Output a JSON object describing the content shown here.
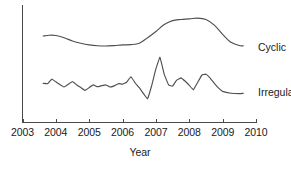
{
  "chart_data": {
    "type": "line",
    "title": "",
    "xlabel": "Year",
    "ylabel": "",
    "grid": false,
    "legend_position": "right-inline",
    "xlim": [
      2003,
      2010
    ],
    "ylim": [
      0,
      10
    ],
    "xticks": [
      2003,
      2004,
      2005,
      2006,
      2007,
      2008,
      2009,
      2010
    ],
    "xtick_labels": [
      "2003",
      "2004",
      "2005",
      "2006",
      "2007",
      "2008",
      "2009",
      "2010"
    ],
    "yticks": [],
    "ytick_labels": [],
    "series": [
      {
        "name": "Cyclic",
        "label_x": 2010.0,
        "label_y": 6.55,
        "x": [
          2003.62,
          2003.8,
          2004.0,
          2004.25,
          2004.5,
          2004.75,
          2005.0,
          2005.25,
          2005.5,
          2005.75,
          2006.0,
          2006.25,
          2006.5,
          2006.75,
          2007.0,
          2007.25,
          2007.5,
          2007.75,
          2008.0,
          2008.25,
          2008.5,
          2008.75,
          2009.0,
          2009.25,
          2009.5,
          2009.62
        ],
        "y": [
          7.55,
          7.62,
          7.6,
          7.4,
          7.12,
          6.92,
          6.78,
          6.7,
          6.68,
          6.72,
          6.78,
          6.8,
          6.92,
          7.4,
          7.95,
          8.55,
          8.9,
          9.0,
          9.05,
          9.12,
          9.0,
          8.5,
          7.7,
          7.0,
          6.72,
          6.7
        ]
      },
      {
        "name": "Irregular",
        "label_x": 2010.0,
        "label_y": 2.55,
        "x": [
          2003.62,
          2003.75,
          2003.88,
          2004.0,
          2004.12,
          2004.25,
          2004.38,
          2004.5,
          2004.62,
          2004.75,
          2004.88,
          2005.0,
          2005.12,
          2005.25,
          2005.38,
          2005.5,
          2005.62,
          2005.75,
          2005.88,
          2006.0,
          2006.12,
          2006.25,
          2006.38,
          2006.5,
          2006.62,
          2006.75,
          2006.88,
          2007.0,
          2007.12,
          2007.25,
          2007.38,
          2007.5,
          2007.62,
          2007.75,
          2007.88,
          2008.0,
          2008.12,
          2008.25,
          2008.38,
          2008.5,
          2008.62,
          2008.75,
          2008.88,
          2009.0,
          2009.25,
          2009.5,
          2009.62
        ],
        "y": [
          3.42,
          3.38,
          3.8,
          3.55,
          3.32,
          3.1,
          3.35,
          3.58,
          3.3,
          3.05,
          2.8,
          3.05,
          3.28,
          3.12,
          3.22,
          3.28,
          3.1,
          3.2,
          3.4,
          3.35,
          3.52,
          4.0,
          3.45,
          3.05,
          2.55,
          2.08,
          3.3,
          4.7,
          5.7,
          4.2,
          3.28,
          3.18,
          3.7,
          3.9,
          3.6,
          3.25,
          2.85,
          3.5,
          4.15,
          4.22,
          3.9,
          3.42,
          3.0,
          2.72,
          2.55,
          2.52,
          2.55
        ]
      }
    ]
  }
}
